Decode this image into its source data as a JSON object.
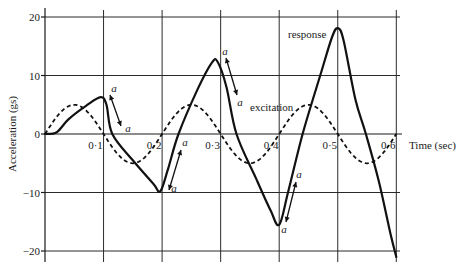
{
  "chart_data": {
    "type": "line",
    "title": "",
    "xlabel": "Time (sec)",
    "ylabel": "Acceleration (gs)",
    "xlim": [
      0,
      0.6
    ],
    "ylim": [
      -20,
      20
    ],
    "x_ticks": [
      "0·1",
      "0·2",
      "0·3",
      "0·4",
      "0·5",
      "0·6"
    ],
    "x_tick_values": [
      0.1,
      0.2,
      0.3,
      0.4,
      0.5,
      0.6
    ],
    "y_ticks": [
      "20",
      "10",
      "0",
      "−10",
      "−20"
    ],
    "y_tick_values": [
      20,
      10,
      0,
      -10,
      -20
    ],
    "grid": true,
    "series": [
      {
        "name": "response",
        "style": "solid",
        "points": [
          [
            0,
            0
          ],
          [
            0.02,
            0.3
          ],
          [
            0.04,
            2.5
          ],
          [
            0.07,
            4.8
          ],
          [
            0.095,
            6.3
          ],
          [
            0.105,
            5.0
          ],
          [
            0.115,
            0
          ],
          [
            0.15,
            -4.5
          ],
          [
            0.185,
            -8.5
          ],
          [
            0.197,
            -9.8
          ],
          [
            0.21,
            -6.0
          ],
          [
            0.228,
            0
          ],
          [
            0.26,
            7.5
          ],
          [
            0.285,
            12.2
          ],
          [
            0.295,
            12.3
          ],
          [
            0.31,
            8.0
          ],
          [
            0.327,
            0
          ],
          [
            0.36,
            -7.5
          ],
          [
            0.385,
            -13.0
          ],
          [
            0.4,
            -15.5
          ],
          [
            0.415,
            -10.0
          ],
          [
            0.44,
            0
          ],
          [
            0.47,
            10.0
          ],
          [
            0.49,
            16.5
          ],
          [
            0.5,
            18.1
          ],
          [
            0.51,
            16.0
          ],
          [
            0.53,
            6.0
          ],
          [
            0.548,
            0
          ],
          [
            0.57,
            -8.0
          ],
          [
            0.59,
            -17.0
          ],
          [
            0.6,
            -21.0
          ]
        ]
      },
      {
        "name": "excitation",
        "style": "dashed",
        "formula": "5*sin(2*pi*t/0.2)",
        "amplitude": 5,
        "period": 0.2,
        "points": [
          [
            0,
            0
          ],
          [
            0.05,
            5
          ],
          [
            0.1,
            0
          ],
          [
            0.15,
            -5
          ],
          [
            0.2,
            0
          ],
          [
            0.25,
            5
          ],
          [
            0.3,
            0
          ],
          [
            0.35,
            -5
          ],
          [
            0.4,
            0
          ],
          [
            0.45,
            5
          ],
          [
            0.5,
            0
          ],
          [
            0.55,
            -5
          ],
          [
            0.6,
            0
          ]
        ]
      }
    ],
    "annotations": [
      {
        "text": "response",
        "x": 0.44,
        "y": 17
      },
      {
        "text": "excitation",
        "x": 0.35,
        "y": 4.5
      },
      {
        "text": "a",
        "note": "double-headed arrows marking segments labelled a at t≈0.1, 0.2, 0.3, 0.4"
      }
    ],
    "legend": "inline labels"
  },
  "labels": {
    "ylabel": "Acceleration (gs)",
    "xlabel": "Time (sec)",
    "response": "response",
    "excitation": "excitation",
    "a": "a",
    "xticks": [
      "0·1",
      "0·2",
      "0·3",
      "0·4",
      "0·5",
      "0·6"
    ],
    "yticks": [
      "20",
      "10",
      "0",
      "−10",
      "−20"
    ]
  }
}
